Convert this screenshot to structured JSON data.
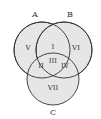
{
  "diagram": {
    "type": "venn",
    "fill_color": "#e6e6e6",
    "stroke_color": "#333333",
    "sets": [
      {
        "id": "A",
        "label": "A"
      },
      {
        "id": "B",
        "label": "B"
      },
      {
        "id": "C",
        "label": "C"
      }
    ],
    "regions": [
      {
        "id": "I",
        "label": "I",
        "sets": [
          "A",
          "B"
        ]
      },
      {
        "id": "II",
        "label": "II",
        "sets": [
          "A",
          "C"
        ]
      },
      {
        "id": "III",
        "label": "III",
        "sets": [
          "A",
          "B",
          "C"
        ]
      },
      {
        "id": "IV",
        "label": "IV",
        "sets": [
          "B",
          "C"
        ]
      },
      {
        "id": "V",
        "label": "V",
        "sets": [
          "A"
        ]
      },
      {
        "id": "VI",
        "label": "VI",
        "sets": [
          "B"
        ]
      },
      {
        "id": "VII",
        "label": "VII",
        "sets": [
          "C"
        ]
      }
    ]
  }
}
